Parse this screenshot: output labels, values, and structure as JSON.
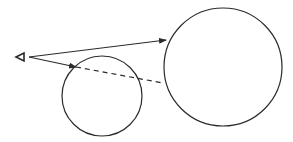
{
  "diagram": {
    "stroke_color": "#2a2a2a",
    "eye": {
      "icon": "eye-triangle-icon",
      "x": 16,
      "y": 57
    },
    "large_circle": {
      "cx": 223,
      "cy": 67,
      "r": 59
    },
    "small_circle": {
      "cx": 102,
      "cy": 96,
      "r": 40
    },
    "sight_line_visible": {
      "x1": 29,
      "y1": 57,
      "x2": 166,
      "y2": 40
    },
    "sight_line_blocked": {
      "x1": 29,
      "y1": 57,
      "x2": 76,
      "y2": 67
    },
    "sight_line_occluded_dashed": {
      "x1": 76,
      "y1": 67,
      "x2": 163,
      "y2": 83
    }
  }
}
